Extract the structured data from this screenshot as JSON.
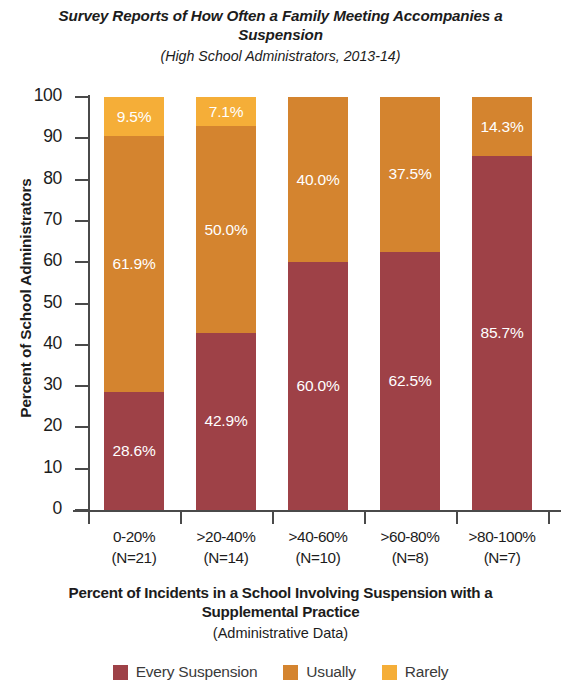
{
  "chart_data": {
    "type": "bar",
    "subtype": "stacked-100-percent",
    "title": "Survey Reports of How Often a Family Meeting Accompanies a Suspension",
    "subtitle": "(High School Administrators, 2013-14)",
    "xlabel": "Percent of Incidents in a School Involving Suspension with a Supplemental Practice",
    "xlabel_sub": "(Administrative Data)",
    "ylabel": "Percent of School Administrators",
    "ylim": [
      0,
      100
    ],
    "ytick_labels": [
      "100",
      "90",
      "80",
      "70",
      "60",
      "50",
      "40",
      "30",
      "20",
      "10",
      "0"
    ],
    "ytick_values": [
      100,
      90,
      80,
      70,
      60,
      50,
      40,
      30,
      20,
      10,
      0
    ],
    "grid": false,
    "legend_position": "bottom",
    "categories": [
      "0-20%",
      ">20-40%",
      ">40-60%",
      ">60-80%",
      ">80-100%"
    ],
    "category_counts": [
      "(N=21)",
      "(N=14)",
      "(N=10)",
      "(N=8)",
      "(N=7)"
    ],
    "series": [
      {
        "name": "Every Suspension",
        "color": "#9e4147",
        "values": [
          28.6,
          42.9,
          60.0,
          62.5,
          85.7
        ],
        "labels": [
          "28.6%",
          "42.9%",
          "60.0%",
          "62.5%",
          "85.7%"
        ]
      },
      {
        "name": "Usually",
        "color": "#d4842f",
        "values": [
          61.9,
          50.0,
          40.0,
          37.5,
          14.3
        ],
        "labels": [
          "61.9%",
          "50.0%",
          "40.0%",
          "37.5%",
          "14.3%"
        ]
      },
      {
        "name": "Rarely",
        "color": "#f5ae38",
        "values": [
          9.5,
          7.1,
          0.0,
          0.0,
          0.0
        ],
        "labels": [
          "9.5%",
          "7.1%",
          "",
          "",
          ""
        ]
      }
    ]
  }
}
